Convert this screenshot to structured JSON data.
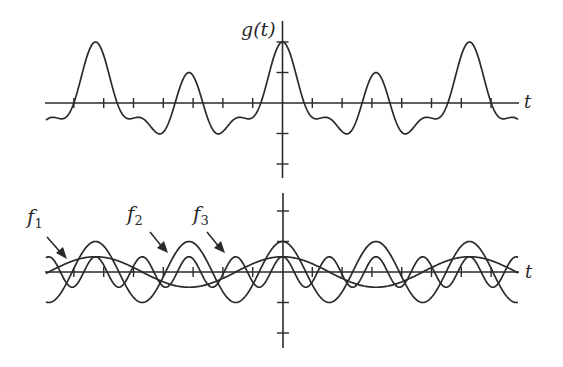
{
  "chart_data": [
    {
      "type": "line",
      "title": "",
      "ylabel": "g(t)",
      "xlabel": "t",
      "description": "Sum signal g(t) = f1(t) + f2(t) + f3(t)",
      "x_ticks_per_side": 8,
      "x_tick_unit": 1,
      "y_ticks": [
        -2,
        -1,
        1,
        2
      ],
      "ylim": [
        -2.4,
        2.6
      ],
      "xlim": [
        -8,
        8
      ],
      "grid": false,
      "series": [
        {
          "name": "g(t)",
          "components": [
            {
              "amplitude": 0.5,
              "harmonic": 1
            },
            {
              "amplitude": 1.0,
              "harmonic": 2
            },
            {
              "amplitude": 0.5,
              "harmonic": 4
            }
          ]
        }
      ],
      "fundamental_period_ticks": 6.28,
      "key_points": [
        {
          "t": 0,
          "g": 2.0
        },
        {
          "t": -6.28,
          "g": 2.0
        },
        {
          "t": 6.28,
          "g": 2.0
        },
        {
          "t": -3.14,
          "g": 1.0
        },
        {
          "t": 3.14,
          "g": 1.0
        }
      ]
    },
    {
      "type": "line",
      "title": "",
      "xlabel": "t",
      "ylabel": "",
      "description": "Component sinusoids f1, f2, f3",
      "y_ticks": [
        -2,
        -1,
        1,
        2
      ],
      "xlim": [
        -8,
        8
      ],
      "grid": false,
      "series": [
        {
          "name": "f1",
          "label": "f",
          "subscript": "1",
          "amplitude": 0.5,
          "harmonic": 1
        },
        {
          "name": "f2",
          "label": "f",
          "subscript": "2",
          "amplitude": 1.0,
          "harmonic": 2
        },
        {
          "name": "f3",
          "label": "f",
          "subscript": "3",
          "amplitude": 0.5,
          "harmonic": 4
        }
      ],
      "annotations": [
        "f1 arrow",
        "f2 arrow",
        "f3 arrow"
      ]
    }
  ],
  "labels": {
    "top_ylabel_main": "g",
    "top_ylabel_paren": "(t)",
    "top_xlabel": "t",
    "bottom_xlabel": "t",
    "f1_main": "f",
    "f1_sub": "1",
    "f2_main": "f",
    "f2_sub": "2",
    "f3_main": "f",
    "f3_sub": "3"
  },
  "layout": {
    "origin_x": 282.5,
    "top_axis_y": 103,
    "bottom_axis_y": 272,
    "x_tick_px": 29.8,
    "y_tick_px": 30.5,
    "period_px": 187,
    "curve_x_start": 46,
    "curve_x_end": 518
  }
}
